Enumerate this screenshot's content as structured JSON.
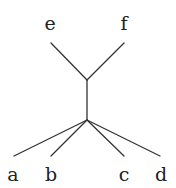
{
  "diagram": {
    "type": "tree",
    "labels": {
      "e": "e",
      "f": "f",
      "a": "a",
      "b": "b",
      "c": "c",
      "d": "d"
    },
    "nodes": [
      {
        "id": "e",
        "label": "e",
        "x": 51,
        "y": 43
      },
      {
        "id": "f",
        "label": "f",
        "x": 124,
        "y": 43
      },
      {
        "id": "upper-junction",
        "label": "",
        "x": 87,
        "y": 80
      },
      {
        "id": "lower-junction",
        "label": "",
        "x": 87,
        "y": 120
      },
      {
        "id": "a",
        "label": "a",
        "x": 14,
        "y": 156
      },
      {
        "id": "b",
        "label": "b",
        "x": 51,
        "y": 156
      },
      {
        "id": "c",
        "label": "c",
        "x": 124,
        "y": 156
      },
      {
        "id": "d",
        "label": "d",
        "x": 160,
        "y": 156
      }
    ],
    "edges": [
      [
        "e",
        "upper-junction"
      ],
      [
        "f",
        "upper-junction"
      ],
      [
        "upper-junction",
        "lower-junction"
      ],
      [
        "lower-junction",
        "a"
      ],
      [
        "lower-junction",
        "b"
      ],
      [
        "lower-junction",
        "c"
      ],
      [
        "lower-junction",
        "d"
      ]
    ],
    "colors": {
      "line": "#333333",
      "text": "#222222",
      "background": "#ffffff"
    }
  }
}
